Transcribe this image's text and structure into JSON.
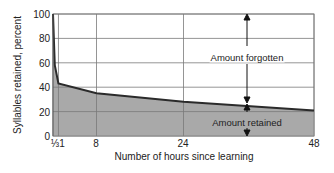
{
  "chart_data": {
    "type": "area",
    "title": "",
    "xlabel": "Number of hours since learning",
    "ylabel": "Syllables retained, percent",
    "x": [
      0,
      0.333,
      1,
      8,
      24,
      48
    ],
    "values": [
      100,
      58,
      43,
      35,
      28,
      21
    ],
    "xticks": [
      {
        "value": 0.333,
        "label": "⅓"
      },
      {
        "value": 1,
        "label": "1"
      },
      {
        "value": 8,
        "label": "8"
      },
      {
        "value": 24,
        "label": "24"
      },
      {
        "value": 48,
        "label": "48"
      }
    ],
    "yticks": [
      0,
      20,
      40,
      60,
      80,
      100
    ],
    "xlim": [
      0,
      48
    ],
    "ylim": [
      0,
      100
    ],
    "grid": true,
    "annotations": [
      {
        "text": "Amount forgotten",
        "x": 36,
        "region": "above curve"
      },
      {
        "text": "Amount retained",
        "x": 36,
        "region": "below curve"
      }
    ],
    "colors": {
      "fill": "#a9a9a9",
      "line": "#2b2b2b",
      "grid": "#7a7a7a"
    }
  },
  "labels": {
    "ylabel": "Syllables retained, percent",
    "xlabel": "Number of hours since learning",
    "y0": "0",
    "y20": "20",
    "y40": "40",
    "y60": "60",
    "y80": "80",
    "y100": "100",
    "x_third": "⅓",
    "x1": "1",
    "x8": "8",
    "x24": "24",
    "x48": "48",
    "forgotten": "Amount forgotten",
    "retained": "Amount retained"
  }
}
